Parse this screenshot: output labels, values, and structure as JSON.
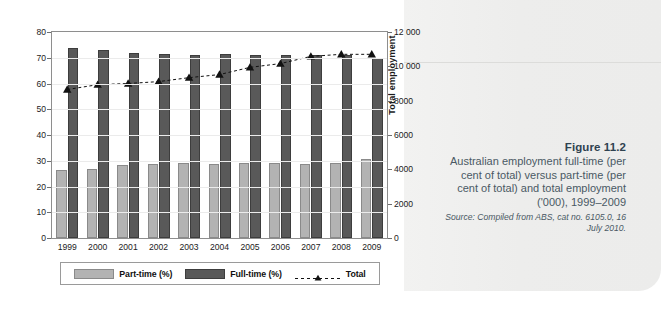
{
  "figure": {
    "title": "Figure 11.2",
    "description": "Australian employment full-time (per cent of total) versus part-time (per cent of total) and total employment ('000), 1999–2009",
    "source": "Source: Compiled from ABS, cat no. 6105.0, 16 July 2010."
  },
  "chart_data": {
    "type": "bar",
    "title": "",
    "xlabel": "",
    "ylabel": "% of total",
    "y2label": "Total employment",
    "categories": [
      "1999",
      "2000",
      "2001",
      "2002",
      "2003",
      "2004",
      "2005",
      "2006",
      "2007",
      "2008",
      "2009"
    ],
    "ylim": [
      0,
      80
    ],
    "y2lim": [
      0,
      12000
    ],
    "yticks": [
      "0",
      "10",
      "20",
      "30",
      "40",
      "50",
      "60",
      "70",
      "80"
    ],
    "y2ticks": [
      "0",
      "2000",
      "4000",
      "6000",
      "8000",
      "10 000",
      "12 000"
    ],
    "grid": true,
    "legend_position": "bottom",
    "series": [
      {
        "name": "Part-time (%)",
        "axis": "left",
        "kind": "bar",
        "color": "#b3b3b3",
        "values": [
          26.3,
          26.9,
          28.3,
          28.7,
          29.1,
          28.9,
          29.2,
          29.0,
          28.8,
          29.2,
          30.8
        ]
      },
      {
        "name": "Full-time (%)",
        "axis": "left",
        "kind": "bar",
        "color": "#595959",
        "values": [
          73.7,
          73.1,
          71.8,
          71.5,
          71.0,
          71.3,
          70.9,
          71.0,
          71.2,
          70.9,
          70.1
        ]
      },
      {
        "name": "Total",
        "axis": "right",
        "kind": "line",
        "color": "#111111",
        "marker": "triangle",
        "linestyle": "dashed",
        "values": [
          8650,
          8930,
          9000,
          9110,
          9340,
          9520,
          9940,
          10160,
          10580,
          10700,
          10700
        ]
      }
    ]
  },
  "legend": {
    "items": [
      {
        "label": "Part-time (%)"
      },
      {
        "label": "Full-time (%)"
      },
      {
        "label": "Total"
      }
    ]
  }
}
